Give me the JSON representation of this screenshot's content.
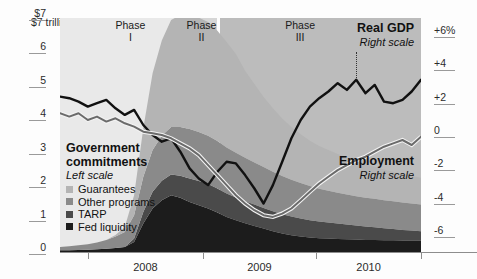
{
  "chart_data": {
    "type": "area",
    "title": "",
    "xlabel": "",
    "ylabel": "$ trillion",
    "x_tick_labels": [
      "2008",
      "2009",
      "2010"
    ],
    "y_left_label_top": "$7 trillion",
    "y_left_ticks": [
      "$7",
      "6",
      "5",
      "4",
      "3",
      "2",
      "1",
      "0"
    ],
    "y_left_values": [
      7,
      6,
      5,
      4,
      3,
      2,
      1,
      0
    ],
    "ylim_left": [
      0,
      7
    ],
    "y_right_ticks": [
      "+6%",
      "+4",
      "+2",
      "0",
      "-2",
      "-4",
      "-6"
    ],
    "y_right_values": [
      6,
      4,
      2,
      0,
      -2,
      -4,
      -6
    ],
    "ylim_right": [
      -7,
      7
    ],
    "grid": false,
    "legend_position": "inside-left",
    "x_range": [
      "2007-07",
      "2010-10"
    ],
    "phases": [
      {
        "label_line1": "Phase",
        "label_line2": "I",
        "start": "2007-07",
        "end": "2008-09",
        "shade": "#e9e9e9"
      },
      {
        "label_line1": "Phase",
        "label_line2": "II",
        "start": "2008-09",
        "end": "2008-12",
        "shade": "#d6d6d6"
      },
      {
        "label_line1": "Phase",
        "label_line2": "III",
        "start": "2008-12",
        "end": "2010-10",
        "shade": "#bcbcbc"
      }
    ],
    "stacked_areas": {
      "legend_title": "Government commitments",
      "legend_scale": "Left scale",
      "order_bottom_to_top": [
        "Fed liquidity",
        "TARP",
        "Other programs",
        "Guarantees"
      ],
      "series": [
        {
          "name": "Fed liquidity",
          "color": "#1c1c1c",
          "values": [
            0.05,
            0.05,
            0.06,
            0.07,
            0.08,
            0.1,
            0.12,
            0.15,
            0.3,
            0.85,
            1.3,
            1.55,
            1.7,
            1.62,
            1.5,
            1.4,
            1.3,
            1.18,
            1.05,
            0.95,
            0.86,
            0.78,
            0.7,
            0.62,
            0.55,
            0.5,
            0.46,
            0.43,
            0.41,
            0.4,
            0.39,
            0.38,
            0.37,
            0.36,
            0.36,
            0.35,
            0.35,
            0.34,
            0.34,
            0.34
          ]
        },
        {
          "name": "TARP",
          "color": "#4a4a4a",
          "values": [
            0,
            0,
            0,
            0,
            0,
            0,
            0,
            0,
            0.1,
            0.35,
            0.5,
            0.58,
            0.62,
            0.66,
            0.7,
            0.72,
            0.73,
            0.72,
            0.7,
            0.68,
            0.66,
            0.64,
            0.62,
            0.6,
            0.58,
            0.56,
            0.54,
            0.52,
            0.5,
            0.48,
            0.46,
            0.44,
            0.42,
            0.4,
            0.38,
            0.36,
            0.34,
            0.32,
            0.3,
            0.28
          ]
        },
        {
          "name": "Other programs",
          "color": "#8a8a8a",
          "values": [
            0.1,
            0.12,
            0.14,
            0.16,
            0.2,
            0.26,
            0.34,
            0.45,
            0.7,
            1.05,
            1.25,
            1.35,
            1.42,
            1.46,
            1.48,
            1.47,
            1.45,
            1.42,
            1.38,
            1.34,
            1.3,
            1.26,
            1.22,
            1.18,
            1.14,
            1.1,
            1.06,
            1.02,
            0.98,
            0.95,
            0.92,
            0.9,
            0.88,
            0.86,
            0.85,
            0.84,
            0.83,
            0.82,
            0.81,
            0.8
          ]
        },
        {
          "name": "Guarantees",
          "color": "#b4b4b4",
          "values": [
            0,
            0,
            0,
            0,
            0,
            0,
            0.05,
            0.15,
            0.6,
            1.45,
            2.3,
            2.85,
            3.2,
            3.35,
            3.4,
            3.42,
            3.4,
            3.3,
            3.15,
            2.95,
            2.6,
            2.35,
            2.1,
            1.9,
            1.72,
            1.58,
            1.46,
            1.36,
            1.28,
            1.22,
            1.16,
            1.1,
            1.05,
            1.0,
            0.96,
            0.92,
            0.88,
            0.85,
            0.82,
            0.8
          ]
        }
      ],
      "peak_total_trillions": 6.5,
      "peak_period": "2009 Q1"
    },
    "lines": [
      {
        "name": "Real GDP",
        "scale": "Right scale",
        "color": "#111111",
        "width": 2.4,
        "label_x": "2010-01",
        "values": [
          2.3,
          2.2,
          2.0,
          1.7,
          1.9,
          2.1,
          1.6,
          1.2,
          1.5,
          0.6,
          0.0,
          -0.4,
          -0.2,
          -1.0,
          -2.0,
          -2.6,
          -3.0,
          -2.2,
          -1.6,
          -1.7,
          -2.4,
          -3.2,
          -4.1,
          -3.0,
          -1.6,
          -0.2,
          0.9,
          1.7,
          2.2,
          2.6,
          3.1,
          2.7,
          3.3,
          2.5,
          3.0,
          2.0,
          1.9,
          2.1,
          2.6,
          3.3
        ]
      },
      {
        "name": "Employment",
        "scale": "Right scale",
        "color": "#6b6b6b",
        "width": 2.0,
        "label_x": "2010-01",
        "values": [
          1.3,
          1.1,
          1.3,
          0.9,
          1.1,
          0.8,
          1.0,
          0.7,
          0.5,
          0.2,
          0.1,
          0.0,
          -0.2,
          -0.5,
          -0.8,
          -1.2,
          -1.8,
          -2.4,
          -3.0,
          -3.6,
          -4.1,
          -4.5,
          -4.8,
          -4.9,
          -4.7,
          -4.4,
          -3.9,
          -3.4,
          -2.9,
          -2.5,
          -2.1,
          -1.8,
          -1.5,
          -1.3,
          -1.0,
          -0.7,
          -0.5,
          -0.3,
          -0.6,
          -0.1
        ]
      }
    ]
  }
}
